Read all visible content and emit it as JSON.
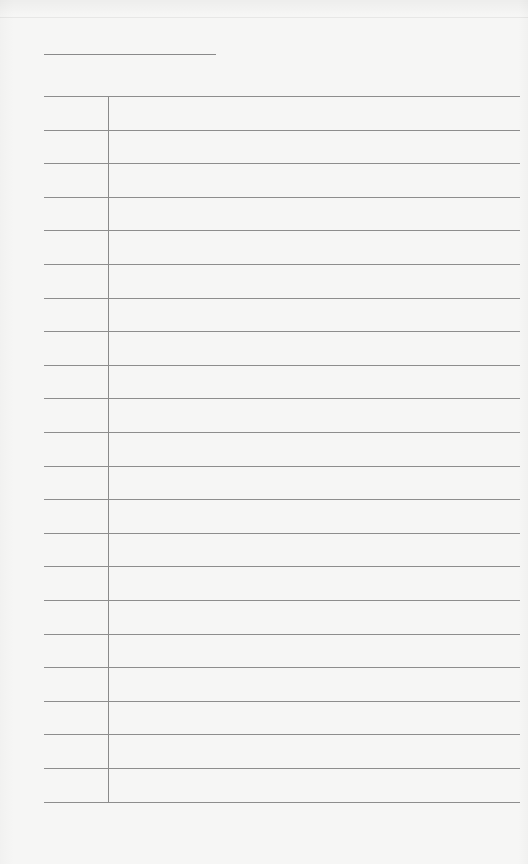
{
  "document": {
    "type": "lined-paper",
    "title_line": {
      "text": ""
    },
    "ruled_lines": {
      "count": 22,
      "top_px": 96,
      "spacing_px": 33.6,
      "color": "#8d8d8d"
    },
    "margin_line": {
      "x_px": 108,
      "color": "#8a8a8a"
    },
    "background_color": "#f6f6f5",
    "rows": [
      "",
      "",
      "",
      "",
      "",
      "",
      "",
      "",
      "",
      "",
      "",
      "",
      "",
      "",
      "",
      "",
      "",
      "",
      "",
      "",
      "",
      ""
    ]
  }
}
